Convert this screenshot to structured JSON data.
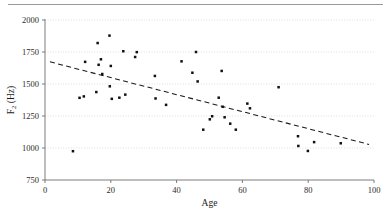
{
  "figure": {
    "name": "scatter-plot-f2-vs-age",
    "has_top_rule": true
  },
  "chart_data": {
    "type": "scatter",
    "title": "",
    "xlabel": "Age",
    "ylabel_main": "F",
    "ylabel_sub": "2",
    "ylabel_unit": " (Hz)",
    "ylabel": "F2 (Hz)",
    "xlim": [
      0,
      100
    ],
    "ylim": [
      750,
      2000
    ],
    "xticks": [
      0,
      20,
      40,
      60,
      80,
      100
    ],
    "xtick_labels": [
      "0",
      "20",
      "40",
      "60",
      "80",
      "100"
    ],
    "yticks": [
      750,
      1000,
      1250,
      1500,
      1750,
      2000
    ],
    "ytick_labels": [
      "750",
      "1000",
      "1250",
      "1500",
      "1750",
      "2000"
    ],
    "grid": true,
    "grid_axis": "y",
    "legend": "none",
    "marker": "square",
    "marker_color": "#111111",
    "points": [
      {
        "x": 8.5,
        "y": 975
      },
      {
        "x": 10.5,
        "y": 1392
      },
      {
        "x": 11.8,
        "y": 1403
      },
      {
        "x": 12.2,
        "y": 1673
      },
      {
        "x": 15.6,
        "y": 1437
      },
      {
        "x": 16.0,
        "y": 1820
      },
      {
        "x": 16.3,
        "y": 1650
      },
      {
        "x": 17.0,
        "y": 1693
      },
      {
        "x": 17.4,
        "y": 1578
      },
      {
        "x": 19.6,
        "y": 1878
      },
      {
        "x": 19.7,
        "y": 1482
      },
      {
        "x": 20.0,
        "y": 1641
      },
      {
        "x": 20.3,
        "y": 1384
      },
      {
        "x": 22.6,
        "y": 1393
      },
      {
        "x": 23.8,
        "y": 1756
      },
      {
        "x": 24.4,
        "y": 1417
      },
      {
        "x": 27.4,
        "y": 1711
      },
      {
        "x": 27.9,
        "y": 1749
      },
      {
        "x": 33.4,
        "y": 1563
      },
      {
        "x": 33.6,
        "y": 1387
      },
      {
        "x": 36.8,
        "y": 1337
      },
      {
        "x": 41.5,
        "y": 1677
      },
      {
        "x": 44.8,
        "y": 1588
      },
      {
        "x": 45.9,
        "y": 1750
      },
      {
        "x": 46.4,
        "y": 1520
      },
      {
        "x": 48.1,
        "y": 1143
      },
      {
        "x": 50.1,
        "y": 1224
      },
      {
        "x": 50.8,
        "y": 1248
      },
      {
        "x": 52.8,
        "y": 1393
      },
      {
        "x": 53.7,
        "y": 1602
      },
      {
        "x": 54.0,
        "y": 1322
      },
      {
        "x": 54.6,
        "y": 1240
      },
      {
        "x": 56.3,
        "y": 1190
      },
      {
        "x": 58.0,
        "y": 1143
      },
      {
        "x": 61.5,
        "y": 1347
      },
      {
        "x": 62.3,
        "y": 1310
      },
      {
        "x": 71.0,
        "y": 1475
      },
      {
        "x": 76.9,
        "y": 1092
      },
      {
        "x": 77.0,
        "y": 1016
      },
      {
        "x": 79.9,
        "y": 977
      },
      {
        "x": 81.8,
        "y": 1046
      },
      {
        "x": 89.9,
        "y": 1037
      }
    ],
    "trend_line": {
      "style": "dashed",
      "x_start": 1.5,
      "y_start": 1673,
      "x_end": 98.5,
      "y_end": 1028
    }
  }
}
